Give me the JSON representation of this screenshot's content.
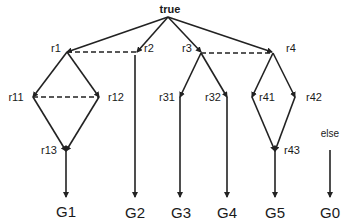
{
  "diagram": {
    "root": {
      "label": "true",
      "x": 170,
      "y": 13
    },
    "nodes": {
      "r1": {
        "label": "r1",
        "x": 67,
        "y": 52
      },
      "r2": {
        "label": "r2",
        "x": 137,
        "y": 52
      },
      "r3": {
        "label": "r3",
        "x": 201,
        "y": 52
      },
      "r4": {
        "label": "r4",
        "x": 272,
        "y": 52
      },
      "r11": {
        "label": "r11",
        "x": 33,
        "y": 97
      },
      "r12": {
        "label": "r12",
        "x": 99,
        "y": 97
      },
      "r13": {
        "label": "r13",
        "x": 66,
        "y": 151
      },
      "r31": {
        "label": "r31",
        "x": 180,
        "y": 97
      },
      "r32": {
        "label": "r32",
        "x": 227,
        "y": 97
      },
      "r41": {
        "label": "r41",
        "x": 252,
        "y": 97
      },
      "r42": {
        "label": "r42",
        "x": 295,
        "y": 97
      },
      "r43": {
        "label": "r43",
        "x": 275,
        "y": 151
      }
    },
    "else_label": "else",
    "goals": {
      "G1": "G1",
      "G2": "G2",
      "G3": "G3",
      "G4": "G4",
      "G5": "G5",
      "G0": "G0"
    },
    "edges": [
      [
        "true",
        "r1"
      ],
      [
        "true",
        "r2"
      ],
      [
        "true",
        "r3"
      ],
      [
        "true",
        "r4"
      ],
      [
        "r1",
        "r11"
      ],
      [
        "r1",
        "r12"
      ],
      [
        "r11",
        "r13"
      ],
      [
        "r12",
        "r13"
      ],
      [
        "r13",
        "G1"
      ],
      [
        "r2",
        "G2"
      ],
      [
        "r3",
        "r31"
      ],
      [
        "r3",
        "r32"
      ],
      [
        "r31",
        "G3"
      ],
      [
        "r32",
        "G4"
      ],
      [
        "r4",
        "r41"
      ],
      [
        "r4",
        "r42"
      ],
      [
        "r41",
        "r43"
      ],
      [
        "r42",
        "r43"
      ],
      [
        "r43",
        "G5"
      ],
      [
        "else",
        "G0"
      ]
    ],
    "dashed_links": [
      [
        "r1",
        "r2"
      ],
      [
        "r11",
        "r12"
      ],
      [
        "r3",
        "r4"
      ]
    ]
  }
}
